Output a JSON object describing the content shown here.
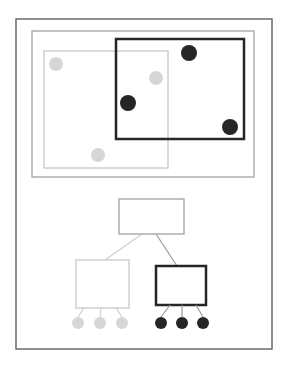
{
  "colors": {
    "background": "#ffffff",
    "frame_outer": "#6a6a6a",
    "frame_inner": "#9a9a9a",
    "light": "#d6d6d6",
    "light_line": "#cfcfcf",
    "dark": "#262626",
    "edge": "#9a9a9a"
  },
  "frames": {
    "outer": {
      "x": 16,
      "y": 19,
      "w": 256,
      "h": 330
    },
    "inner": {
      "x": 32,
      "y": 31,
      "w": 222,
      "h": 146
    }
  },
  "spatial_panel": {
    "light_region": {
      "x": 44,
      "y": 51,
      "w": 124,
      "h": 117
    },
    "dark_region": {
      "x": 116,
      "y": 39,
      "w": 128,
      "h": 100
    },
    "light_points": [
      {
        "cx": 56,
        "cy": 64,
        "r": 7
      },
      {
        "cx": 156,
        "cy": 78,
        "r": 7
      },
      {
        "cx": 98,
        "cy": 155,
        "r": 7
      }
    ],
    "dark_points": [
      {
        "cx": 189,
        "cy": 53,
        "r": 8
      },
      {
        "cx": 128,
        "cy": 103,
        "r": 8
      },
      {
        "cx": 230,
        "cy": 127,
        "r": 8
      }
    ]
  },
  "tree_panel": {
    "root": {
      "x": 119,
      "y": 199,
      "w": 65,
      "h": 35
    },
    "light_child": {
      "x": 76,
      "y": 260,
      "w": 53,
      "h": 48
    },
    "dark_child": {
      "x": 156,
      "y": 266,
      "w": 50,
      "h": 39
    },
    "edges": [
      {
        "x1": 142,
        "y1": 234,
        "x2": 105,
        "y2": 260,
        "style": "light"
      },
      {
        "x1": 156,
        "y1": 234,
        "x2": 177,
        "y2": 266,
        "style": "mid"
      }
    ],
    "light_leaves": [
      {
        "cx": 78,
        "cy": 323,
        "r": 6,
        "from_x": 84,
        "from_y": 308
      },
      {
        "cx": 100,
        "cy": 323,
        "r": 6,
        "from_x": 101,
        "from_y": 308
      },
      {
        "cx": 122,
        "cy": 323,
        "r": 6,
        "from_x": 116,
        "from_y": 308
      }
    ],
    "dark_leaves": [
      {
        "cx": 161,
        "cy": 323,
        "r": 6,
        "from_x": 170,
        "from_y": 305
      },
      {
        "cx": 182,
        "cy": 323,
        "r": 6,
        "from_x": 182,
        "from_y": 305
      },
      {
        "cx": 203,
        "cy": 323,
        "r": 6,
        "from_x": 196,
        "from_y": 305
      }
    ]
  }
}
